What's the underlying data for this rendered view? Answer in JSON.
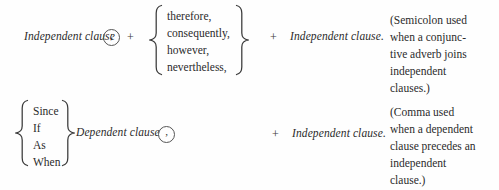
{
  "figure": {
    "type": "grammar-punctuation-pattern-diagram",
    "background_color": "#fefefe",
    "text_color": "#2b2b2b"
  },
  "row1": {
    "subject": "Independent clause",
    "punctuation_mark": ";",
    "punctuation_name": "semicolon",
    "plus1": "+",
    "connectors": [
      "therefore,",
      "consequently,",
      "however,",
      "nevertheless,"
    ],
    "plus2": "+",
    "predicate": "Independent clause.",
    "note_lines": [
      "(Semicolon used",
      "when a conjunc-",
      "tive adverb joins",
      "independent",
      "clauses.)"
    ]
  },
  "row2": {
    "subordinators": [
      "Since",
      "If",
      "As",
      "When"
    ],
    "subject": "Dependent clause",
    "punctuation_mark": ",",
    "punctuation_name": "comma",
    "plus1": "+",
    "predicate": "Independent clause.",
    "note_lines": [
      "(Comma used",
      "when a dependent",
      "clause precedes an",
      "independent",
      "clause.)"
    ]
  }
}
